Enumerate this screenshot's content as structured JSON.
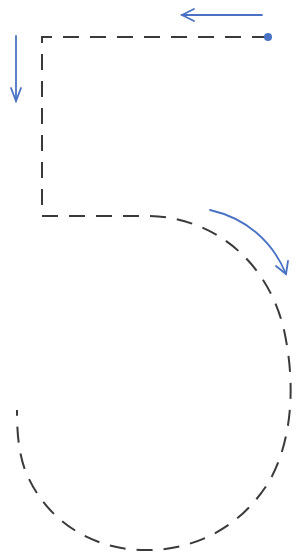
{
  "diagram": {
    "colors": {
      "background": "#ffffff",
      "stroke_path": "#3a3a3a",
      "arrow": "#4a72c4",
      "start_dot": "#4a72c4"
    },
    "start_point": {
      "x": 268,
      "y": 37
    },
    "segments": [
      {
        "name": "top-bar",
        "from": [
          268,
          37
        ],
        "to": [
          42,
          37
        ],
        "direction": "left"
      },
      {
        "name": "vertical-stem",
        "from": [
          42,
          37
        ],
        "to": [
          42,
          216
        ],
        "direction": "down"
      },
      {
        "name": "bowl-curve",
        "from": [
          42,
          216
        ],
        "to": [
          17,
          410
        ],
        "direction": "clockwise"
      }
    ],
    "arrows": [
      {
        "name": "arrow-left",
        "label": "left"
      },
      {
        "name": "arrow-down",
        "label": "down"
      },
      {
        "name": "arrow-curve",
        "label": "clockwise"
      }
    ]
  }
}
